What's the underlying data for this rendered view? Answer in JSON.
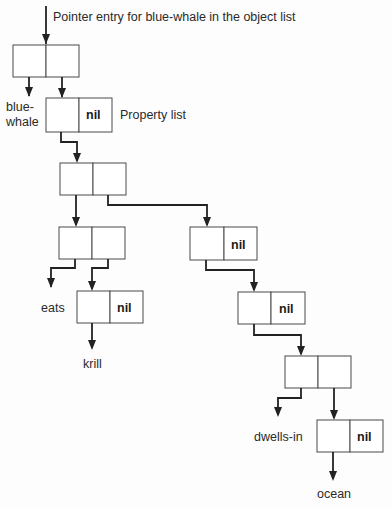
{
  "diagram": {
    "title": "Pointer entry for blue-whale in the object list",
    "labels": {
      "symbol_name_line1": "blue-",
      "symbol_name_line2": "whale",
      "property_list": "Property list",
      "eats": "eats",
      "krill": "krill",
      "dwells_in": "dwells-in",
      "ocean": "ocean"
    },
    "nil_text": "nil",
    "cells": [
      {
        "id": "object-cell",
        "car": "",
        "cdr": ""
      },
      {
        "id": "plist-head-cell",
        "car": "",
        "cdr": "nil"
      },
      {
        "id": "plist-spine-1",
        "car": "",
        "cdr": ""
      },
      {
        "id": "eats-pair-cell",
        "car": "",
        "cdr": ""
      },
      {
        "id": "krill-list-cell",
        "car": "",
        "cdr": "nil"
      },
      {
        "id": "plist-spine-2",
        "car": "",
        "cdr": "nil"
      },
      {
        "id": "plist-spine-3",
        "car": "",
        "cdr": "nil"
      },
      {
        "id": "dwells-pair-cell",
        "car": "",
        "cdr": ""
      },
      {
        "id": "ocean-list-cell",
        "car": "",
        "cdr": "nil"
      }
    ],
    "colors": {
      "line": "#222222",
      "box_stroke": "#4a4a4a",
      "background": "#fdfdfd"
    }
  }
}
